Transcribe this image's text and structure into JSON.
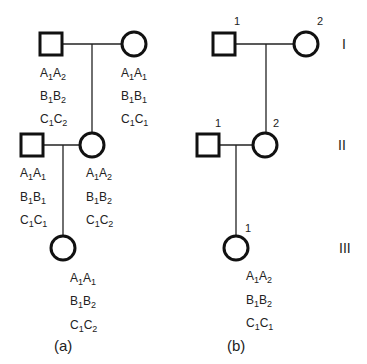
{
  "panels": [
    {
      "caption": "(a)",
      "individuals": [
        {
          "id": "a-I-father",
          "sex": "male",
          "genotype": [
            [
              "A",
              "1",
              "A",
              "2"
            ],
            [
              "B",
              "1",
              "B",
              "2"
            ],
            [
              "C",
              "1",
              "C",
              "2"
            ]
          ]
        },
        {
          "id": "a-I-mother",
          "sex": "female",
          "genotype": [
            [
              "A",
              "1",
              "A",
              "1"
            ],
            [
              "B",
              "1",
              "B",
              "1"
            ],
            [
              "C",
              "1",
              "C",
              "1"
            ]
          ]
        },
        {
          "id": "a-II-father",
          "sex": "male",
          "genotype": [
            [
              "A",
              "1",
              "A",
              "1"
            ],
            [
              "B",
              "1",
              "B",
              "1"
            ],
            [
              "C",
              "1",
              "C",
              "1"
            ]
          ]
        },
        {
          "id": "a-II-mother",
          "sex": "female",
          "genotype": [
            [
              "A",
              "1",
              "A",
              "2"
            ],
            [
              "B",
              "1",
              "B",
              "2"
            ],
            [
              "C",
              "1",
              "C",
              "2"
            ]
          ]
        },
        {
          "id": "a-III-daughter",
          "sex": "female",
          "genotype": [
            [
              "A",
              "1",
              "A",
              "1"
            ],
            [
              "B",
              "1",
              "B",
              "2"
            ],
            [
              "C",
              "1",
              "C",
              "2"
            ]
          ]
        }
      ]
    },
    {
      "caption": "(b)",
      "generation_labels": [
        "I",
        "II",
        "III"
      ],
      "individuals": [
        {
          "id": "b-I-1",
          "sex": "male",
          "number": "1"
        },
        {
          "id": "b-I-2",
          "sex": "female",
          "number": "2"
        },
        {
          "id": "b-II-1",
          "sex": "male",
          "number": "1"
        },
        {
          "id": "b-II-2",
          "sex": "female",
          "number": "2"
        },
        {
          "id": "b-III-1",
          "sex": "female",
          "number": "1",
          "genotype": [
            [
              "A",
              "1",
              "A",
              "2"
            ],
            [
              "B",
              "1",
              "B",
              "2"
            ],
            [
              "C",
              "1",
              "C",
              "1"
            ]
          ]
        }
      ]
    }
  ]
}
